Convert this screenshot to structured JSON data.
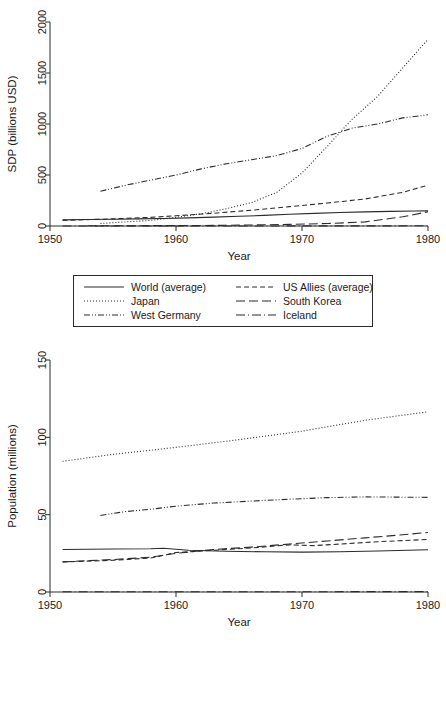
{
  "figures": [
    {
      "id": "gdp",
      "chart_index": 0
    },
    {
      "id": "pop",
      "chart_index": 1
    }
  ],
  "legend": {
    "entries": [
      {
        "label": "World (average)",
        "style": "solid"
      },
      {
        "label": "US Allies (average)",
        "style": "short-dash"
      },
      {
        "label": "Japan",
        "style": "dotted"
      },
      {
        "label": "South Korea",
        "style": "long-dash"
      },
      {
        "label": "West Germany",
        "style": "dash-dot-dot"
      },
      {
        "label": "Iceland",
        "style": "dash-dot"
      }
    ],
    "position": "below-axes",
    "columns": 2
  },
  "chart_data": [
    {
      "type": "line",
      "title": "",
      "xlabel": "Year",
      "ylabel": "SDP (billions USD)",
      "xlim": [
        1950,
        1980
      ],
      "ylim": [
        0,
        2000
      ],
      "xticks": [
        1950,
        1960,
        1970,
        1980
      ],
      "yticks": [
        0,
        500,
        1000,
        1500,
        2000
      ],
      "grid": false,
      "legend_position": "below",
      "series": [
        {
          "name": "World (average)",
          "style": "solid",
          "x": [
            1951,
            1953,
            1955,
            1957,
            1959,
            1961,
            1963,
            1965,
            1967,
            1969,
            1971,
            1973,
            1975,
            1977,
            1979,
            1980
          ],
          "values": [
            60,
            63,
            66,
            70,
            74,
            80,
            87,
            95,
            104,
            115,
            124,
            133,
            138,
            143,
            147,
            148
          ]
        },
        {
          "name": "Japan",
          "style": "dotted",
          "x": [
            1954,
            1956,
            1958,
            1960,
            1962,
            1964,
            1966,
            1968,
            1970,
            1972,
            1974,
            1976,
            1978,
            1980
          ],
          "values": [
            25,
            40,
            55,
            85,
            120,
            170,
            230,
            330,
            520,
            780,
            1050,
            1270,
            1550,
            1830
          ]
        },
        {
          "name": "West Germany",
          "style": "dash-dot-dot",
          "x": [
            1954,
            1956,
            1958,
            1960,
            1962,
            1964,
            1966,
            1968,
            1970,
            1972,
            1974,
            1976,
            1978,
            1980
          ],
          "values": [
            340,
            400,
            450,
            500,
            560,
            610,
            650,
            690,
            760,
            880,
            960,
            1000,
            1060,
            1090
          ]
        },
        {
          "name": "US Allies (average)",
          "style": "short-dash",
          "x": [
            1951,
            1955,
            1958,
            1960,
            1963,
            1966,
            1969,
            1972,
            1975,
            1978,
            1980
          ],
          "values": [
            55,
            70,
            85,
            100,
            125,
            155,
            190,
            225,
            265,
            330,
            400
          ]
        },
        {
          "name": "South Korea",
          "style": "long-dash",
          "x": [
            1953,
            1957,
            1960,
            1963,
            1966,
            1969,
            1972,
            1975,
            1978,
            1980
          ],
          "values": [
            2,
            3,
            4,
            6,
            10,
            16,
            24,
            40,
            90,
            140
          ]
        },
        {
          "name": "Iceland",
          "style": "dash-dot",
          "x": [
            1951,
            1960,
            1970,
            1980
          ],
          "values": [
            0.3,
            0.5,
            0.8,
            2.0
          ]
        }
      ]
    },
    {
      "type": "line",
      "title": "",
      "xlabel": "Year",
      "ylabel": "Population (millions)",
      "xlim": [
        1950,
        1980
      ],
      "ylim": [
        0,
        150
      ],
      "xticks": [
        1950,
        1960,
        1970,
        1980
      ],
      "yticks": [
        0,
        50,
        100,
        150
      ],
      "grid": false,
      "legend_position": "below",
      "series": [
        {
          "name": "World (average)",
          "style": "solid",
          "x": [
            1951,
            1955,
            1958,
            1959,
            1961,
            1964,
            1967,
            1970,
            1973,
            1976,
            1980
          ],
          "values": [
            27.5,
            27.8,
            28.0,
            28.3,
            27.0,
            26.3,
            26.0,
            25.8,
            26.0,
            26.5,
            27.3
          ]
        },
        {
          "name": "Japan",
          "style": "dotted",
          "x": [
            1951,
            1955,
            1960,
            1965,
            1970,
            1975,
            1980
          ],
          "values": [
            84.5,
            89.0,
            93.5,
            98.5,
            104.0,
            111.0,
            116.5
          ]
        },
        {
          "name": "West Germany",
          "style": "dash-dot-dot",
          "x": [
            1954,
            1956,
            1958,
            1960,
            1963,
            1966,
            1969,
            1972,
            1975,
            1978,
            1980
          ],
          "values": [
            49.5,
            52.0,
            53.5,
            55.5,
            57.5,
            58.8,
            60.0,
            61.0,
            61.5,
            61.3,
            61.2
          ]
        },
        {
          "name": "US Allies (average)",
          "style": "short-dash",
          "x": [
            1951,
            1955,
            1958,
            1960,
            1963,
            1966,
            1969,
            1971,
            1973,
            1976,
            1980
          ],
          "values": [
            19.5,
            20.5,
            22.0,
            25.5,
            27.0,
            28.5,
            30.5,
            30.0,
            31.0,
            32.5,
            34.0
          ]
        },
        {
          "name": "South Korea",
          "style": "long-dash",
          "x": [
            1951,
            1955,
            1958,
            1960,
            1963,
            1966,
            1969,
            1972,
            1975,
            1978,
            1980
          ],
          "values": [
            19.5,
            21.0,
            22.5,
            25.0,
            27.5,
            29.0,
            31.0,
            33.0,
            35.0,
            37.0,
            38.5
          ]
        },
        {
          "name": "Iceland",
          "style": "dash-dot",
          "x": [
            1951,
            1960,
            1970,
            1980
          ],
          "values": [
            0.15,
            0.18,
            0.2,
            0.23
          ]
        }
      ]
    }
  ]
}
